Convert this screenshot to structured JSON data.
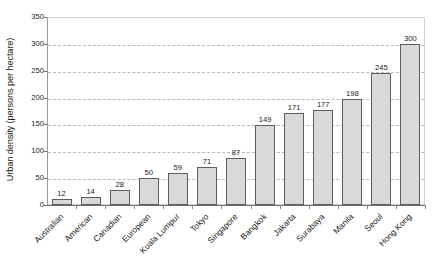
{
  "chart_data": {
    "type": "bar",
    "title": "",
    "xlabel": "",
    "ylabel": "Urban density (persons per hectare)",
    "ylim": [
      0,
      350
    ],
    "yticks": [
      0,
      50,
      100,
      150,
      200,
      250,
      300,
      350
    ],
    "grid": true,
    "grid_style": "dashed-horizontal",
    "legend": "none",
    "categories": [
      "Australian",
      "American",
      "Canadian",
      "European",
      "Kuala Lumpur",
      "Tokyo",
      "Singapore",
      "Bangkok",
      "Jakarta",
      "Surabaya",
      "Manila",
      "Seoul",
      "Hong Kong"
    ],
    "values": [
      12,
      14,
      28,
      50,
      59,
      71,
      87,
      149,
      171,
      177,
      198,
      245,
      300
    ],
    "data_labels": [
      "12",
      "14",
      "28",
      "50",
      "59",
      "71",
      "87",
      "149",
      "171",
      "177",
      "198",
      "245",
      "300"
    ],
    "bar_color": "#d9d9d9",
    "bar_border_color": "#5d5d5d",
    "gridline_color": "#b9b9b9",
    "axis_color": "#6e6e6e",
    "background_color": "#ffffff"
  }
}
